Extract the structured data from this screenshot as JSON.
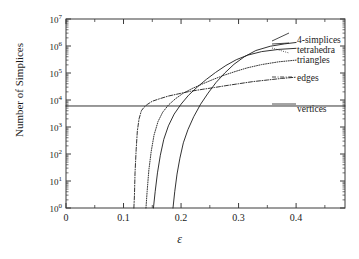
{
  "chart_data": {
    "type": "line",
    "title": "",
    "xlabel": "ε",
    "ylabel": "Number of Simplices",
    "xlim": [
      0,
      0.485
    ],
    "ylim": [
      1,
      10000000
    ],
    "yscale": "log",
    "grid": false,
    "legend_position": "right-inline",
    "xticks": [
      "0",
      "0.1",
      "0.2",
      "0.3",
      "0.4"
    ],
    "xtick_values": [
      0,
      0.1,
      0.2,
      0.3,
      0.4
    ],
    "ytick_labels": [
      "10⁰",
      "10¹",
      "10²",
      "10³",
      "10⁴",
      "10⁵",
      "10⁶",
      "10⁷"
    ],
    "ytick_exponents": [
      0,
      1,
      2,
      3,
      4,
      5,
      6,
      7
    ],
    "series": [
      {
        "name": "vertices",
        "style": "solid",
        "constant": 6000,
        "points": [
          [
            0.0,
            6000
          ],
          [
            0.485,
            6000
          ]
        ]
      },
      {
        "name": "edges",
        "style": "dash-dot",
        "points": [
          [
            0.118,
            1
          ],
          [
            0.119,
            3
          ],
          [
            0.12,
            20
          ],
          [
            0.122,
            150
          ],
          [
            0.124,
            700
          ],
          [
            0.127,
            2000
          ],
          [
            0.131,
            4000
          ],
          [
            0.136,
            5500
          ],
          [
            0.142,
            7000
          ],
          [
            0.15,
            9000
          ],
          [
            0.162,
            11000
          ],
          [
            0.178,
            14000
          ],
          [
            0.196,
            17000
          ],
          [
            0.216,
            21000
          ],
          [
            0.238,
            25000
          ],
          [
            0.258,
            29000
          ],
          [
            0.278,
            34000
          ],
          [
            0.3,
            40000
          ],
          [
            0.325,
            48000
          ],
          [
            0.35,
            55000
          ],
          [
            0.375,
            63000
          ],
          [
            0.4,
            70000
          ]
        ]
      },
      {
        "name": "triangles",
        "style": "dotted",
        "points": [
          [
            0.139,
            1
          ],
          [
            0.141,
            4
          ],
          [
            0.144,
            25
          ],
          [
            0.148,
            120
          ],
          [
            0.153,
            500
          ],
          [
            0.16,
            1600
          ],
          [
            0.168,
            3500
          ],
          [
            0.178,
            6500
          ],
          [
            0.19,
            11000
          ],
          [
            0.204,
            18000
          ],
          [
            0.22,
            27000
          ],
          [
            0.238,
            40000
          ],
          [
            0.256,
            58000
          ],
          [
            0.275,
            83000
          ],
          [
            0.295,
            115000
          ],
          [
            0.315,
            155000
          ],
          [
            0.34,
            205000
          ],
          [
            0.37,
            260000
          ],
          [
            0.4,
            300000
          ]
        ]
      },
      {
        "name": "tetrahedra",
        "style": "solid",
        "points": [
          [
            0.152,
            1
          ],
          [
            0.155,
            4
          ],
          [
            0.159,
            20
          ],
          [
            0.164,
            90
          ],
          [
            0.17,
            350
          ],
          [
            0.178,
            1100
          ],
          [
            0.188,
            3000
          ],
          [
            0.2,
            7000
          ],
          [
            0.213,
            15000
          ],
          [
            0.228,
            30000
          ],
          [
            0.244,
            58000
          ],
          [
            0.26,
            105000
          ],
          [
            0.278,
            190000
          ],
          [
            0.296,
            310000
          ],
          [
            0.316,
            460000
          ],
          [
            0.34,
            620000
          ],
          [
            0.37,
            750000
          ],
          [
            0.4,
            820000
          ]
        ]
      },
      {
        "name": "4-simplices",
        "style": "solid",
        "points": [
          [
            0.186,
            1
          ],
          [
            0.189,
            4
          ],
          [
            0.193,
            18
          ],
          [
            0.198,
            70
          ],
          [
            0.204,
            260
          ],
          [
            0.212,
            800
          ],
          [
            0.222,
            2400
          ],
          [
            0.234,
            7000
          ],
          [
            0.247,
            18000
          ],
          [
            0.261,
            45000
          ],
          [
            0.276,
            100000
          ],
          [
            0.292,
            210000
          ],
          [
            0.31,
            400000
          ],
          [
            0.33,
            680000
          ],
          [
            0.355,
            980000
          ],
          [
            0.38,
            1200000
          ],
          [
            0.4,
            1350000
          ]
        ]
      }
    ]
  },
  "axes": {
    "y_title": "Number of Simplices",
    "x_title": "ε"
  },
  "legend": {
    "items": [
      {
        "label": "4-simplices"
      },
      {
        "label": "tetrahedra"
      },
      {
        "label": "triangles"
      },
      {
        "label": "edges"
      },
      {
        "label": "vertices"
      }
    ]
  }
}
